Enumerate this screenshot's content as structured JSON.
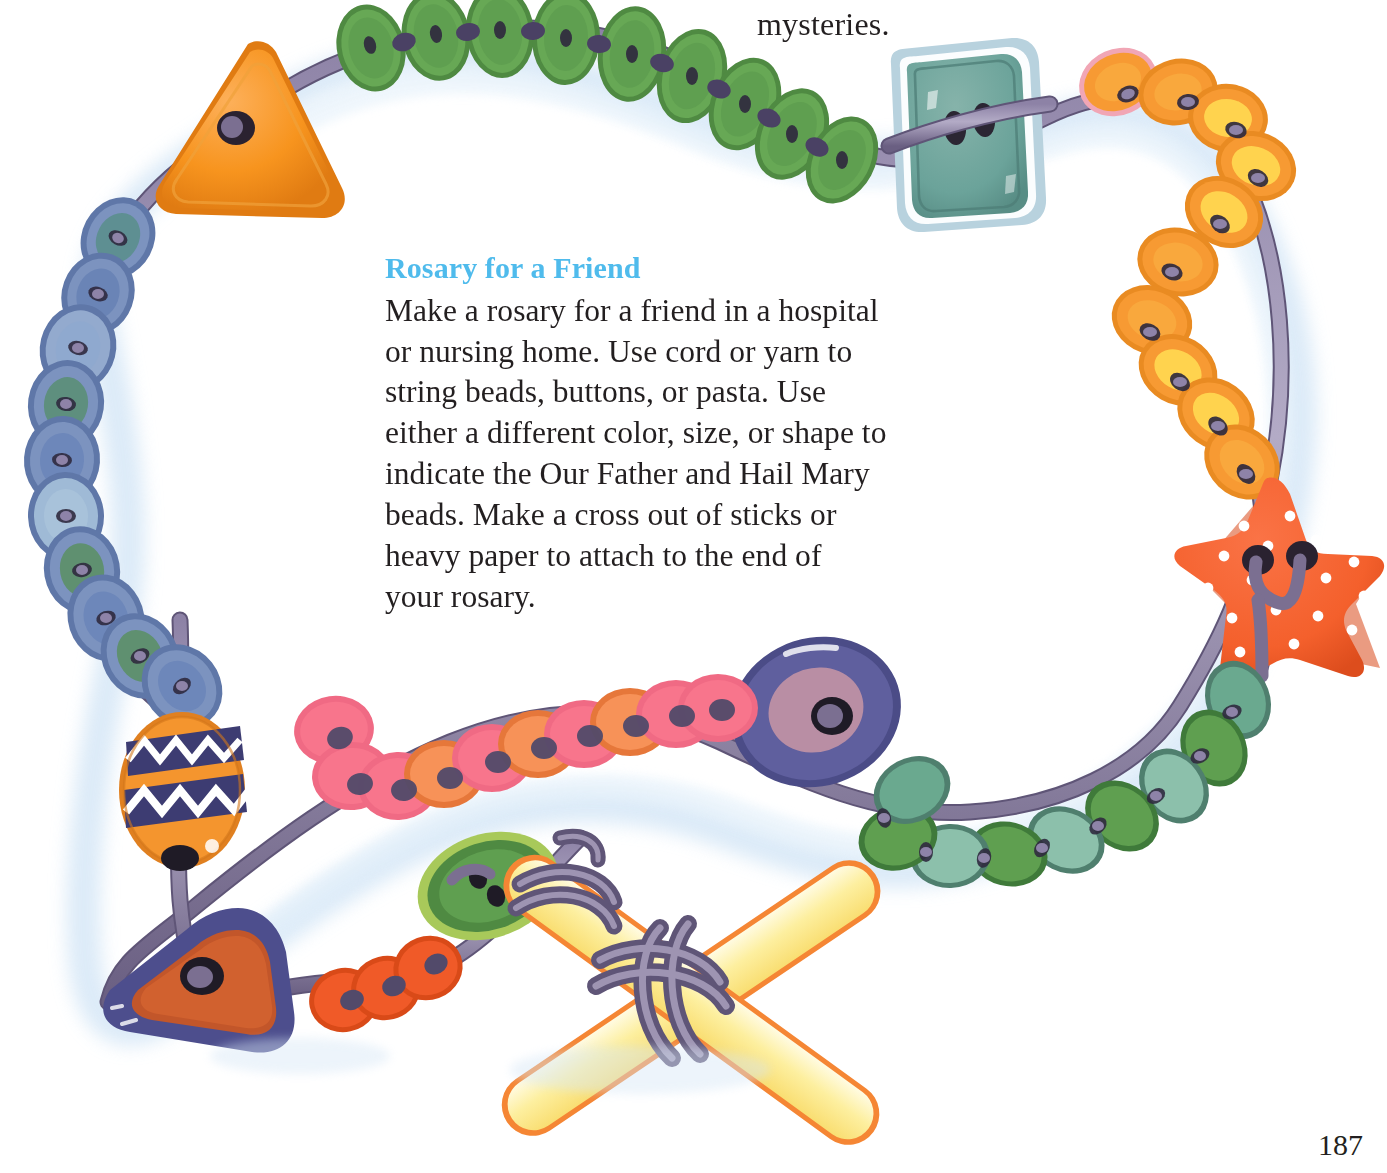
{
  "page": {
    "number": "187",
    "background_color": "#ffffff"
  },
  "carryover_text": {
    "clipped_line": "",
    "last_word": "mysteries."
  },
  "article": {
    "heading": "Rosary for a Friend",
    "heading_color": "#4fbbec",
    "body_lines": [
      "Make a rosary for a friend in a hospital",
      "or nursing home. Use cord or yarn to",
      "string beads, buttons, or pasta. Use",
      "either a different color, size, or shape to",
      "indicate the Our Father and Hail Mary",
      "beads. Make a cross out of sticks or",
      "heavy paper to attach to the end of",
      "your rosary."
    ],
    "body_color": "#231f20"
  },
  "illustration": {
    "title": "handmade-rosary-of-buttons-and-beads",
    "description": "A loop of cord strung with assorted buttons and beads surrounding the text, ending in a cross made of two popsicle sticks tied with cord.",
    "cord_color": "#7b6f91",
    "cord_highlight": "#a9a0bd",
    "shadow_color": "#c9ddf0",
    "elements": [
      {
        "name": "green-button-chain-top",
        "color": "#5f9f50",
        "count": 12
      },
      {
        "name": "orange-triangle-bead",
        "color": "#f7941e"
      },
      {
        "name": "blue-button-chain-left",
        "color": "#6d86b8",
        "count": 11
      },
      {
        "name": "teal-square-button",
        "color": "#6ba39a"
      },
      {
        "name": "orange-yellow-button-chain-right",
        "color": "#f99d2a",
        "accent": "#ffd34e",
        "count": 12
      },
      {
        "name": "orange-star-bead",
        "color": "#f4602c",
        "dots": "#ffffff"
      },
      {
        "name": "green-button-chain-right",
        "color": "#5f9f50",
        "accent": "#8fc4b4",
        "count": 11
      },
      {
        "name": "large-purple-button",
        "color": "#5a5b96",
        "center": "#b58ca0"
      },
      {
        "name": "pink-button-chain",
        "color": "#f8758c",
        "accent": "#f79258",
        "count": 13
      },
      {
        "name": "striped-egg-bead",
        "color": "#f4952e",
        "bands": "#3d3c72",
        "zigzag": "#ffffff"
      },
      {
        "name": "navy-triangle-button",
        "color": "#4d4e8d",
        "center": "#d1612f"
      },
      {
        "name": "orange-button-chain-bottom",
        "color": "#f05a28",
        "count": 3
      },
      {
        "name": "green-round-button-cross",
        "color": "#5f9f50",
        "rim": "#a8c95a"
      },
      {
        "name": "popsicle-stick-cross",
        "color": "#fdf0a8",
        "edge": "#f58634"
      }
    ]
  }
}
